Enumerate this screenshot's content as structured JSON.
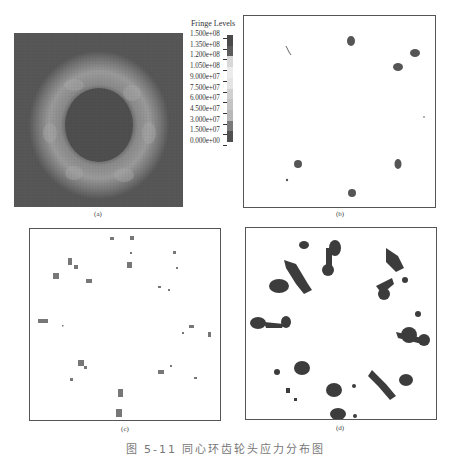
{
  "figure": {
    "caption": "图 5-11  同心环齿轮头应力分布图",
    "legend": {
      "title": "Fringe Levels",
      "levels": [
        "1.500e+08",
        "1.350e+08",
        "1.200e+08",
        "1.050e+08",
        "9.000e+07",
        "7.500e+07",
        "6.000e+07",
        "4.500e+07",
        "3.000e+07",
        "1.500e+07",
        "0.000e+00"
      ],
      "segment_colors": [
        "#4a4a4a",
        "#5c5c5c",
        "#d8d8d8",
        "#ececec",
        "#e4e4e4",
        "#d0d0d0",
        "#c4c4c4",
        "#b8b8b8",
        "#7a7a7a",
        "#505050"
      ]
    },
    "panels": [
      {
        "id": "a",
        "label": "(a)",
        "description": "full stress fringe plot, ring-shaped high stress band"
      },
      {
        "id": "b",
        "label": "(b)",
        "description": "isolated stress concentration spots"
      },
      {
        "id": "c",
        "label": "(c)",
        "description": "sparse scattered elements"
      },
      {
        "id": "d",
        "label": "(d)",
        "description": "clustered stress regions around ring"
      }
    ]
  }
}
